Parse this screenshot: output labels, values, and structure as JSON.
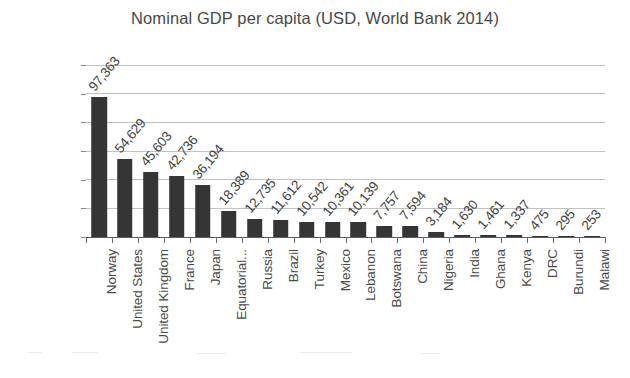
{
  "chart_data": {
    "type": "bar",
    "title": "Nominal GDP per capita (USD, World Bank 2014)",
    "xlabel": "",
    "ylabel": "",
    "ylim": [
      0,
      120000
    ],
    "ytick_labels": [
      "0",
      "20,000",
      "40,000",
      "60,000",
      "80,000",
      "100,000",
      "120,000"
    ],
    "ytick_values": [
      0,
      20000,
      40000,
      60000,
      80000,
      100000,
      120000
    ],
    "grid": true,
    "legend": "none",
    "bar_color": "#353535",
    "categories": [
      "Norway",
      "United States",
      "United Kingdom",
      "France",
      "Japan",
      "Equatorial...",
      "Russia",
      "Brazil",
      "Turkey",
      "Mexico",
      "Lebanon",
      "Botswana",
      "China",
      "Nigeria",
      "India",
      "Ghana",
      "Kenya",
      "DRC",
      "Burundi",
      "Malawi"
    ],
    "values": [
      97363,
      54629,
      45603,
      42736,
      36194,
      18389,
      12735,
      11612,
      10542,
      10361,
      10139,
      7757,
      7594,
      3184,
      1630,
      1461,
      1337,
      475,
      295,
      253
    ],
    "value_labels": [
      "97,363",
      "54,629",
      "45,603",
      "42,736",
      "36,194",
      "18,389",
      "12,735",
      "11,612",
      "10,542",
      "10,361",
      "10,139",
      "7,757",
      "7,594",
      "3,184",
      "1,630",
      "1,461",
      "1,337",
      "475",
      "295",
      "253"
    ]
  }
}
